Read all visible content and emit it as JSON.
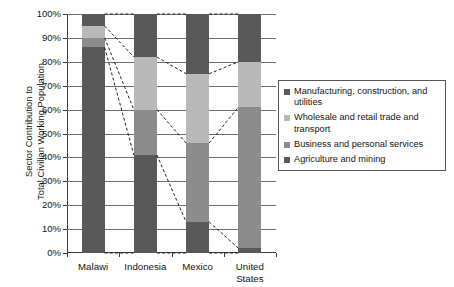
{
  "chart_data": {
    "type": "bar",
    "subtype": "stacked-100-percent",
    "title": "",
    "xlabel": "",
    "ylabel": "Sector Contribution to Total Civilian Working Population",
    "ylabel_lines": [
      "Sector Contribution to",
      "Total Civilian Working Population"
    ],
    "ylim": [
      0,
      100
    ],
    "y_tick_labels": [
      "0%",
      "10%",
      "20%",
      "30%",
      "40%",
      "50%",
      "60%",
      "70%",
      "80%",
      "90%",
      "100%"
    ],
    "y_tick_values": [
      0,
      10,
      20,
      30,
      40,
      50,
      60,
      70,
      80,
      90,
      100
    ],
    "grid": true,
    "legend_position": "right",
    "categories": [
      "Malawi",
      "Indonesia",
      "Mexico",
      "United States"
    ],
    "category_label_lines": [
      [
        "Malawi"
      ],
      [
        "Indonesia"
      ],
      [
        "Mexico"
      ],
      [
        "United",
        "States"
      ]
    ],
    "series": [
      {
        "name": "Manufacturing, construction, and utilities",
        "name_lines": [
          "Manufacturing, construction,",
          "and utilities"
        ],
        "color": "#595959",
        "values": [
          5,
          18,
          25,
          20
        ]
      },
      {
        "name": "Wholesale and retail trade and transport",
        "name_lines": [
          "Wholesale and retail trade and",
          "transport"
        ],
        "color": "#b9b9b9",
        "values": [
          5,
          22,
          29,
          19
        ]
      },
      {
        "name": "Business and personal services",
        "name_lines": [
          "Business and personal services"
        ],
        "color": "#8c8c8c",
        "values": [
          4,
          19,
          33,
          59
        ]
      },
      {
        "name": "Agriculture and mining",
        "name_lines": [
          "Agriculture and mining"
        ],
        "color": "#595959",
        "values": [
          86,
          41,
          13,
          2
        ]
      }
    ],
    "stack_order_top_to_bottom": [
      "Manufacturing, construction, and utilities",
      "Wholesale and retail trade and transport",
      "Business and personal services",
      "Agriculture and mining"
    ],
    "cumulative_boundaries_from_top": {
      "Malawi": [
        100,
        95,
        90,
        86,
        0
      ],
      "Indonesia": [
        100,
        82,
        60,
        41,
        0
      ],
      "Mexico": [
        100,
        75,
        46,
        13,
        0
      ],
      "United States": [
        100,
        80,
        61,
        2,
        0
      ]
    },
    "connector_lines": {
      "style": "dashed",
      "color": "#222222",
      "description": "Dashed leader lines connecting matching segment boundaries between adjacent bars"
    },
    "colors": {
      "gridline": "#6e6e6e",
      "axis": "#3d3d3d",
      "background": "#ffffff",
      "text": "#141414",
      "legend_border": "#555555"
    }
  },
  "legend": {
    "items": [
      {
        "label_line1": "Manufacturing, construction,",
        "label_line2": "and utilities"
      },
      {
        "label_line1": "Wholesale and retail trade and",
        "label_line2": "transport"
      },
      {
        "label_line1": "Business and personal services",
        "label_line2": ""
      },
      {
        "label_line1": "Agriculture and mining",
        "label_line2": ""
      }
    ]
  }
}
